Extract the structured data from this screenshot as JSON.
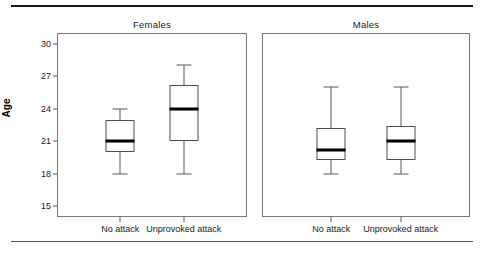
{
  "figure": {
    "y_axis_label": "Age",
    "top_rule": true,
    "bottom_rule": true
  },
  "chart_data": {
    "type": "box",
    "title": "",
    "xlabel": "",
    "ylabel": "Age",
    "ylim": [
      14.0,
      31.0
    ],
    "yticks": [
      15,
      18,
      21,
      24,
      27,
      30
    ],
    "ytick_labels": [
      "15",
      "18",
      "21",
      "24",
      "27",
      "30"
    ],
    "grid": false,
    "legend": "none",
    "panels": [
      {
        "name": "Females",
        "categories": [
          "No attack",
          "Unprovoked attack"
        ],
        "boxes": [
          {
            "category": "No attack",
            "whisker_low": 18.0,
            "q1": 20.0,
            "median": 21.0,
            "q3": 23.0,
            "whisker_high": 24.0
          },
          {
            "category": "Unprovoked attack",
            "whisker_low": 18.0,
            "q1": 21.0,
            "median": 24.0,
            "q3": 26.2,
            "whisker_high": 28.0
          }
        ]
      },
      {
        "name": "Males",
        "categories": [
          "No attack",
          "Unprovoked attack"
        ],
        "boxes": [
          {
            "category": "No attack",
            "whisker_low": 18.0,
            "q1": 19.3,
            "median": 20.2,
            "q3": 22.2,
            "whisker_high": 26.0
          },
          {
            "category": "Unprovoked attack",
            "whisker_low": 18.0,
            "q1": 19.3,
            "median": 21.0,
            "q3": 22.4,
            "whisker_high": 26.0
          }
        ]
      }
    ]
  }
}
